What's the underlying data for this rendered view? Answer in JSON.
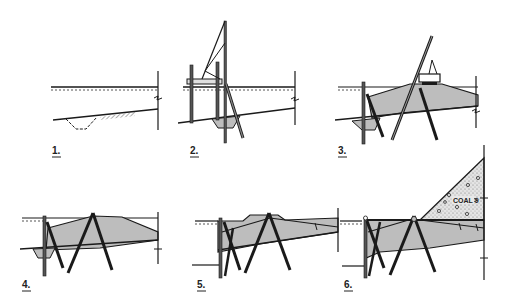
{
  "figure": {
    "panels": [
      {
        "label": "1."
      },
      {
        "label": "2."
      },
      {
        "label": "3."
      },
      {
        "label": "4."
      },
      {
        "label": "5."
      },
      {
        "label": "6."
      }
    ],
    "annotations": {
      "coal_seam": "COAL 9"
    },
    "colors": {
      "line": "#1a1a1a",
      "fill_gray": "#bdbdbd",
      "coal_fill": "#d9d9d9",
      "background": "#ffffff"
    }
  }
}
